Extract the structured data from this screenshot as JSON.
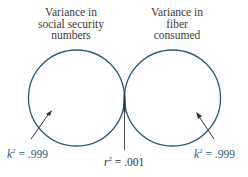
{
  "diagram": {
    "left_circle": {
      "label_lines": [
        "Variance in",
        "social security",
        "numbers"
      ],
      "annotation_var": "k",
      "annotation_exp": "2",
      "annotation_value": " = .999"
    },
    "right_circle": {
      "label_lines": [
        "Variance in",
        "fiber",
        "consumed"
      ],
      "annotation_var": "k",
      "annotation_exp": "2",
      "annotation_value": " = .999"
    },
    "overlap": {
      "annotation_var": "r",
      "annotation_exp": "2",
      "annotation_value": " = .001"
    },
    "colors": {
      "circle_stroke": "#2a5a72",
      "overlap_fill": "#1e3e56",
      "arrow": "#333333",
      "k_text": "#2a5a7a"
    }
  }
}
